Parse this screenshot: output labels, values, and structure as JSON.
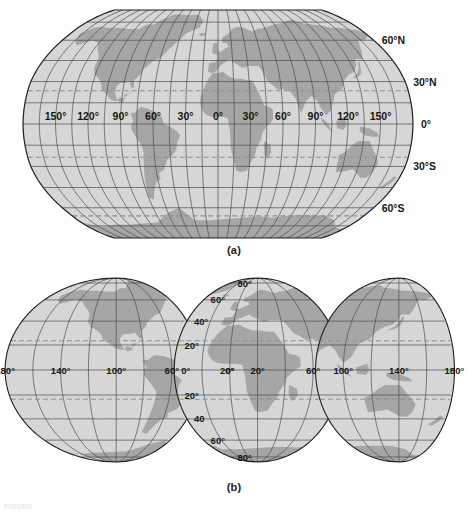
{
  "figure": {
    "panels": [
      {
        "id": "a",
        "caption": "(a)",
        "projection": "robinson",
        "ocean_color": "#d6d6d6",
        "land_color": "#a6a6a6",
        "graticule_color": "#4a4a4a",
        "tropic_color": "#8e8e8e",
        "outline_color": "#1f1f1f",
        "longitude_labels": [
          "150°",
          "120°",
          "90°",
          "60°",
          "30°",
          "0°",
          "30°",
          "60°",
          "90°",
          "120°",
          "150°"
        ],
        "longitude_values": [
          -150,
          -120,
          -90,
          -60,
          -30,
          0,
          30,
          60,
          90,
          120,
          150
        ],
        "latitude_labels": [
          "60°N",
          "30°N",
          "0°",
          "30°S",
          "60°S"
        ],
        "latitude_values": [
          60,
          30,
          0,
          -30,
          -60
        ],
        "graticule_spacing_deg": {
          "lon": 15,
          "lat": 15
        },
        "dashed_latitudes": [
          23.5,
          -23.5,
          -66.5
        ]
      },
      {
        "id": "b",
        "caption": "(b)",
        "projection": "interrupted-goode-homolosine",
        "ocean_color": "#d6d6d6",
        "land_color": "#a6a6a6",
        "graticule_color": "#4a4a4a",
        "tropic_color": "#8e8e8e",
        "outline_color": "#1f1f1f",
        "longitude_labels": [
          "180°",
          "140°",
          "100°",
          "60°",
          "20°",
          "0°",
          "20°",
          "60°",
          "100°",
          "140°",
          "180°"
        ],
        "longitude_values": [
          -180,
          -140,
          -100,
          -60,
          -20,
          0,
          20,
          60,
          100,
          140,
          180
        ],
        "latitude_labels_north": [
          "80°",
          "60°",
          "40°",
          "20°",
          "0°"
        ],
        "latitude_labels_south": [
          "20°",
          "40",
          "60°",
          "80°"
        ],
        "latitude_values": [
          80,
          60,
          40,
          20,
          0,
          -20,
          -40,
          -60,
          -80
        ],
        "graticule_spacing_deg": {
          "lon": 20,
          "lat": 20
        },
        "dashed_latitudes": [
          23.5,
          -23.5
        ]
      }
    ]
  },
  "chart_data": {
    "type": "map",
    "title": "",
    "maps": [
      {
        "name": "Robinson world map",
        "label": "(a)",
        "lon_ticks": [
          -150,
          -120,
          -90,
          -60,
          -30,
          0,
          30,
          60,
          90,
          120,
          150
        ],
        "lon_tick_labels": [
          "150°",
          "120°",
          "90°",
          "60°",
          "30°",
          "0°",
          "30°",
          "60°",
          "90°",
          "120°",
          "150°"
        ],
        "lat_ticks": [
          60,
          30,
          0,
          -30,
          -60
        ],
        "lat_tick_labels": [
          "60°N",
          "30°N",
          "0°",
          "30°S",
          "60°S"
        ],
        "grid": true,
        "xlim": [
          -180,
          180
        ],
        "ylim": [
          -90,
          90
        ]
      },
      {
        "name": "Interrupted (Goode homolosine) world map",
        "label": "(b)",
        "lon_ticks": [
          -180,
          -140,
          -100,
          -60,
          -20,
          0,
          20,
          60,
          100,
          140,
          180
        ],
        "lon_tick_labels": [
          "180°",
          "140°",
          "100°",
          "60°",
          "20°",
          "0°",
          "20°",
          "60°",
          "100°",
          "140°",
          "180°"
        ],
        "lat_ticks": [
          80,
          60,
          40,
          20,
          0,
          -20,
          -40,
          -60,
          -80
        ],
        "lat_tick_labels": [
          "80°",
          "60°",
          "40°",
          "20°",
          "0°",
          "20°",
          "40",
          "60°",
          "80°"
        ],
        "grid": true,
        "xlim": [
          -180,
          180
        ],
        "ylim": [
          -90,
          90
        ]
      }
    ]
  }
}
